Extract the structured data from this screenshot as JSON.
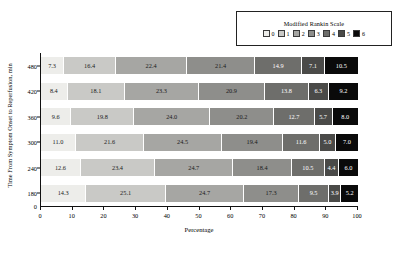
{
  "chart_data": {
    "type": "bar",
    "orientation": "horizontal",
    "stacked": true,
    "percent_stacked": true,
    "title": "",
    "xlabel": "Percentage",
    "ylabel": "Time From Symptom Onset to Reperfusion, min",
    "xlim": [
      0,
      100
    ],
    "xticks": [
      0,
      10,
      20,
      30,
      40,
      50,
      60,
      70,
      80,
      90,
      100
    ],
    "categories": [
      "480",
      "420",
      "360",
      "300",
      "240",
      "180"
    ],
    "grid": false,
    "legend_position": "top-right",
    "legend_title": "Modified Rankin Scale",
    "series": [
      {
        "name": "0",
        "color": "#ededea",
        "values": [
          7.3,
          8.4,
          9.6,
          11.0,
          12.6,
          14.3
        ]
      },
      {
        "name": "1",
        "color": "#c9c9c6",
        "values": [
          16.4,
          18.1,
          19.8,
          21.6,
          23.4,
          25.1
        ]
      },
      {
        "name": "2",
        "color": "#a6a6a3",
        "values": [
          22.4,
          23.3,
          24.0,
          24.5,
          24.7,
          24.7
        ]
      },
      {
        "name": "3",
        "color": "#8e8e8b",
        "values": [
          21.4,
          20.9,
          20.2,
          19.4,
          18.4,
          17.3
        ]
      },
      {
        "name": "4",
        "color": "#6e6e6b",
        "values": [
          14.9,
          13.8,
          12.7,
          11.6,
          10.5,
          9.5
        ]
      },
      {
        "name": "5",
        "color": "#4a4a48",
        "values": [
          7.1,
          6.3,
          5.7,
          5.0,
          4.4,
          3.9
        ]
      },
      {
        "name": "6",
        "color": "#0a0a0a",
        "values": [
          10.5,
          9.2,
          8.0,
          7.0,
          6.0,
          5.2
        ]
      }
    ],
    "label_text_colors": [
      "#1a1a1a",
      "#1a1a1a",
      "#1a1a1a",
      "#1a1a1a",
      "#ffffff",
      "#ffffff",
      "#ffffff"
    ]
  }
}
